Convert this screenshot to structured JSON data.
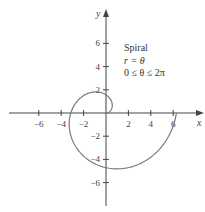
{
  "chart_data": {
    "type": "line",
    "subtype": "polar-curve",
    "title": "Spiral",
    "equation": "r = θ",
    "domain": "0 ≤ θ ≤ 2π",
    "xlabel": "x",
    "ylabel": "y",
    "xlim": [
      -8,
      8.5
    ],
    "ylim": [
      -8,
      9
    ],
    "x_ticks": [
      -6,
      -4,
      -2,
      2,
      4,
      6
    ],
    "y_ticks": [
      6,
      4,
      2,
      -2,
      -4,
      -6
    ],
    "x_tick_labels": [
      "−6",
      "−4",
      "−2",
      "2",
      "4",
      "6"
    ],
    "y_tick_labels": [
      "6",
      "4",
      "2",
      "−2",
      "−4",
      "−6"
    ],
    "grid": false,
    "legend_position": "upper-right",
    "theta_range": [
      0,
      6.2832
    ],
    "series": [
      {
        "name": "r = θ",
        "points": [
          [
            0,
            0
          ],
          [
            0.38,
            0.2
          ],
          [
            0.56,
            0.64
          ],
          [
            0.3,
            1.27
          ],
          [
            -0.42,
            1.74
          ],
          [
            -1.31,
            1.64
          ],
          [
            -2.22,
            1.08
          ],
          [
            -2.97,
            0.07
          ],
          [
            -3.08,
            -0.87
          ],
          [
            -2.82,
            -2.04
          ],
          [
            -2.15,
            -3.12
          ],
          [
            -1.2,
            -4.06
          ],
          [
            0,
            -4.71
          ],
          [
            1.36,
            -4.87
          ],
          [
            2.66,
            -4.49
          ],
          [
            3.9,
            -3.53
          ],
          [
            5.0,
            -2.18
          ],
          [
            5.8,
            -0.9
          ],
          [
            6.28,
            0
          ]
        ]
      }
    ],
    "colors": {
      "axis": "#444444",
      "curve": "#7a7a7a",
      "text": "#333333"
    }
  },
  "legend": {
    "title": "Spiral",
    "line1": "r = θ",
    "line2": "0 ≤ θ ≤ 2π"
  },
  "axes": {
    "x_label": "x",
    "y_label": "y"
  }
}
